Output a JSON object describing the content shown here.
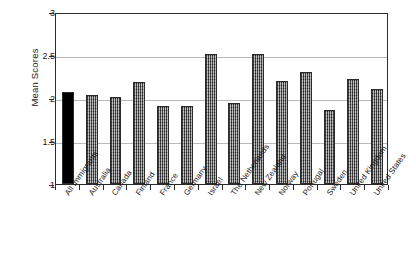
{
  "chart_data": {
    "type": "bar",
    "title": "",
    "subtitle": "",
    "xlabel": "",
    "ylabel": "Mean Scores",
    "ylim": [
      1,
      3
    ],
    "yticks": [
      1,
      1.5,
      2,
      2.5,
      3
    ],
    "ytick_labels": [
      "1",
      "1.5",
      "2",
      "2.5",
      "3"
    ],
    "grid": true,
    "grid_axis": "y",
    "legend": false,
    "legend_position": "none",
    "categories": [
      "All Immigrants",
      "Australia",
      "Canada",
      "Finland",
      "France",
      "Germany",
      "Israel",
      "The Netherlands",
      "New Zealand",
      "Norway",
      "Portugal",
      "Sweden",
      "United Kingdom",
      "United States"
    ],
    "values": [
      2.07,
      2.04,
      2.01,
      2.19,
      1.91,
      1.91,
      2.51,
      1.94,
      2.51,
      2.2,
      2.3,
      1.86,
      2.22,
      2.11
    ],
    "bar_styles": [
      "solid",
      "hatched",
      "hatched",
      "hatched",
      "hatched",
      "hatched",
      "hatched",
      "hatched",
      "hatched",
      "hatched",
      "hatched",
      "hatched",
      "hatched",
      "hatched"
    ],
    "colors": {
      "highlight_bar": "#000000",
      "series_bar": "#7b7b7b",
      "axis": "#2b2b2b",
      "gridline": "#b9b9b9",
      "background": "#ffffff"
    }
  }
}
